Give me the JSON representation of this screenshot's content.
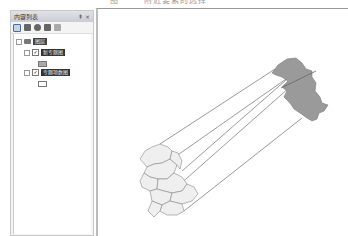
{
  "caption": "图 · · · 附近要素的选择",
  "toc": {
    "title": "内容列表",
    "title_buttons": [
      "pin",
      "close"
    ],
    "pin_glyph": "⇞",
    "close_glyph": "×",
    "toolbar_icons": [
      "list-by-drawing-order-icon",
      "list-by-source-icon",
      "list-by-visibility-icon",
      "list-by-selection-icon",
      "options-icon"
    ],
    "layers_group": {
      "label": "图层",
      "expanded": true
    },
    "layers": [
      {
        "label": "新专题图",
        "checked": true,
        "expanded": true,
        "symbol": "filled"
      },
      {
        "label": "专题项数图",
        "checked": true,
        "expanded": true,
        "symbol": "empty"
      }
    ]
  },
  "map": {
    "source_shape_color": "#eeeeee",
    "target_shape_color": "#999999",
    "link_line_color": "#555555"
  }
}
